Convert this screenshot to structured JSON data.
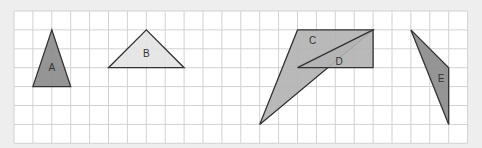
{
  "grid": {
    "origin_x": 14,
    "origin_y": 11,
    "cell": 18.9,
    "cols": 24,
    "rows": 7,
    "background": "#ffffff",
    "line_color": "#d2d2d2"
  },
  "triangles": [
    {
      "label": "A",
      "points": [
        [
          2,
          1
        ],
        [
          1,
          4
        ],
        [
          3,
          4
        ]
      ],
      "fill": "#8c8c8c",
      "label_pos": [
        2,
        3.05
      ]
    },
    {
      "label": "B",
      "points": [
        [
          7,
          1
        ],
        [
          5,
          3
        ],
        [
          9,
          3
        ]
      ],
      "fill": "#e4e4e4",
      "label_pos": [
        7,
        2.3
      ]
    },
    {
      "label": "C",
      "points": [
        [
          13,
          6
        ],
        [
          15,
          1
        ],
        [
          19,
          1
        ]
      ],
      "fill": "#b3b3b3",
      "label_pos": [
        15.8,
        1.6
      ]
    },
    {
      "label": "D",
      "points": [
        [
          15,
          3
        ],
        [
          19,
          3
        ],
        [
          19,
          1
        ]
      ],
      "fill": "#b3b3b3",
      "label_pos": [
        17.2,
        2.7
      ]
    },
    {
      "label": "E",
      "points": [
        [
          21,
          1
        ],
        [
          23,
          3
        ],
        [
          23,
          6
        ]
      ],
      "fill": "#8c8c8c",
      "label_pos": [
        22.6,
        3.6
      ]
    }
  ],
  "stroke": "#333333"
}
